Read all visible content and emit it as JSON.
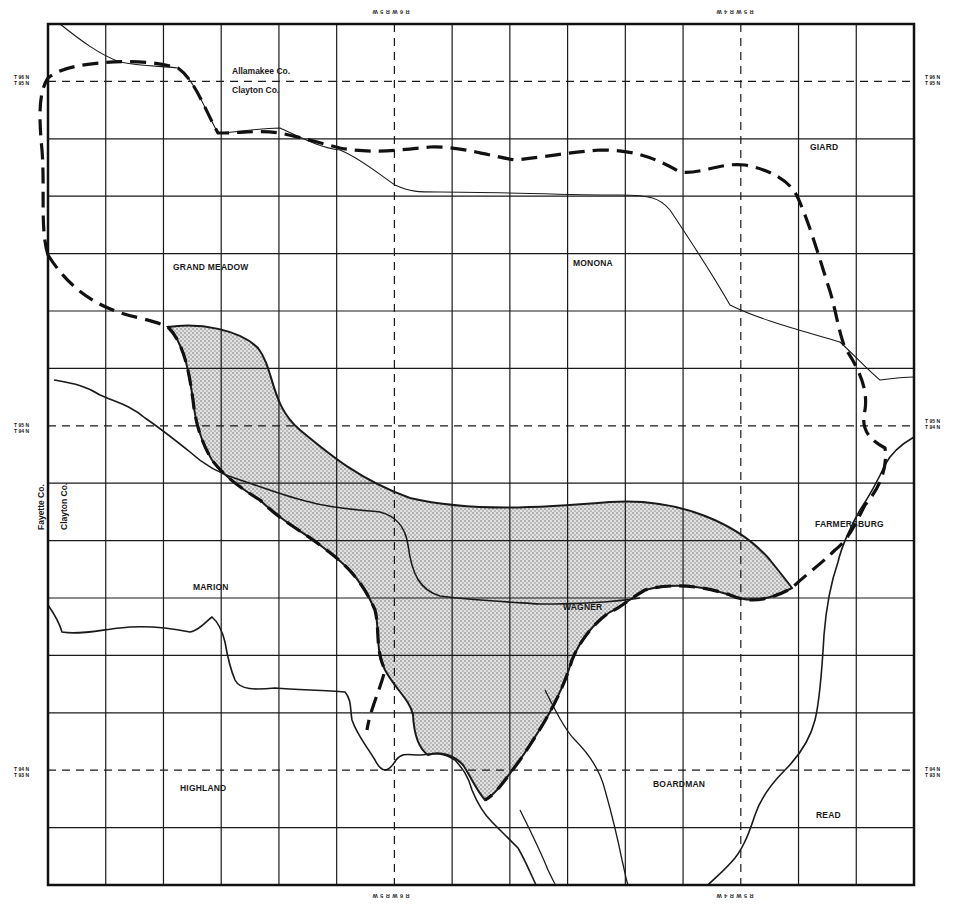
{
  "map": {
    "frame": {
      "x": 48,
      "y": 24,
      "width": 866,
      "height": 861
    },
    "grid": {
      "columns": 15,
      "rows": 15,
      "dashed_columns": [
        6,
        12
      ],
      "dashed_rows": [
        1,
        7,
        13
      ],
      "line_color": "#1a1a1a",
      "frame_color": "#111111"
    },
    "colors": {
      "ink": "#1a1a1a",
      "shade_fill": "#d6d6d6",
      "background": "#ffffff"
    },
    "township_labels": [
      {
        "id": "grand-meadow",
        "text": "GRAND MEADOW",
        "x": 173,
        "y": 263
      },
      {
        "id": "monona",
        "text": "MONONA",
        "x": 573,
        "y": 259
      },
      {
        "id": "giard",
        "text": "GIARD",
        "x": 810,
        "y": 143
      },
      {
        "id": "farmersburg",
        "text": "FARMERSBURG",
        "x": 815,
        "y": 520
      },
      {
        "id": "marion",
        "text": "MARION",
        "x": 193,
        "y": 583
      },
      {
        "id": "wagner",
        "text": "WAGNER",
        "x": 563,
        "y": 603
      },
      {
        "id": "highland",
        "text": "HIGHLAND",
        "x": 180,
        "y": 784
      },
      {
        "id": "boardman",
        "text": "BOARDMAN",
        "x": 653,
        "y": 780
      },
      {
        "id": "read",
        "text": "READ",
        "x": 816,
        "y": 811
      }
    ],
    "county_labels": [
      {
        "id": "allamakee",
        "text": "Allamakee Co.",
        "x": 232,
        "y": 67
      },
      {
        "id": "clayton-top",
        "text": "Clayton Co.",
        "x": 232,
        "y": 86
      }
    ],
    "vertical_county_labels": [
      {
        "id": "fayette",
        "text": "Fayette Co.",
        "x": 37,
        "y": 530
      },
      {
        "id": "clayton-left",
        "text": "Clayton Co.",
        "x": 60,
        "y": 530
      }
    ],
    "range_labels": [
      {
        "id": "top-left",
        "text": "R 6 W R 5 W",
        "x": 372,
        "y": 8
      },
      {
        "id": "top-right",
        "text": "R 5 W R 4 W",
        "x": 716,
        "y": 8
      },
      {
        "id": "bottom-left",
        "text": "R 6 W R 5 W",
        "x": 372,
        "y": 892
      },
      {
        "id": "bottom-right",
        "text": "R 5 W R 4 W",
        "x": 716,
        "y": 892
      }
    ],
    "township_row_labels": [
      {
        "id": "left-96-95",
        "top": "T 96 N",
        "bottom": "T 95 N",
        "x": 14,
        "y": 74
      },
      {
        "id": "left-95-94",
        "top": "T 95 N",
        "bottom": "T 94 N",
        "x": 14,
        "y": 422
      },
      {
        "id": "left-94-93",
        "top": "T 94 N",
        "bottom": "T 93 N",
        "x": 14,
        "y": 766
      },
      {
        "id": "right-96-95",
        "top": "T 96 N",
        "bottom": "T 95 N",
        "x": 925,
        "y": 74
      },
      {
        "id": "right-95-94",
        "top": "T 95 N",
        "bottom": "T 94 N",
        "x": 925,
        "y": 418
      },
      {
        "id": "right-94-93",
        "top": "T 94 N",
        "bottom": "T 93 N",
        "x": 925,
        "y": 766
      }
    ],
    "paths": {
      "shaded_area": "M168,327 C200,322 240,330 258,348 C275,370 270,405 300,430 C330,455 360,480 410,498 C470,512 540,508 610,502 C680,497 740,525 770,560 C782,575 790,585 792,588 C770,600 750,604 730,595 C700,585 670,583 645,590 C628,600 620,608 610,612 C595,622 580,640 572,660 C560,700 540,730 520,760 C505,780 495,795 485,800 C476,790 470,775 463,765 C455,756 440,750 428,755 C418,748 414,735 413,715 C410,700 396,690 385,670 C375,650 380,630 375,610 C360,575 340,560 320,545 C300,530 280,520 260,500 C240,488 222,474 212,460 C200,440 195,420 193,400 C190,380 186,345 168,327 Z",
      "dashed_boundary": "M48,255 C40,230 45,190 42,150 C38,110 40,90 48,78 C60,68 80,65 100,63 C120,61 150,60 178,68 C195,80 205,110 218,133 C240,133 260,130 280,133 C300,137 320,143 340,148 C370,154 400,150 430,147 C460,146 490,156 515,160 C545,157 570,152 600,150 C630,150 650,155 680,172 C700,175 720,162 745,165 C770,170 790,180 798,198 C810,225 820,260 828,285 C835,305 838,330 845,348 C860,370 868,390 865,410 C860,430 870,440 885,448 C888,470 878,490 865,505 C855,525 848,540 835,550 C820,565 805,575 792,588 C770,600 750,604 730,595 C700,585 670,583 645,590 C628,600 620,608 610,612 C595,622 580,640 572,660 C560,700 540,730 520,760 C505,780 495,795 485,800 M48,255 C70,290 100,310 140,318 C155,322 165,325 168,327 C186,345 190,380 193,400 C195,420 200,440 212,460 C222,474 240,488 260,500 C280,520 300,530 320,545 C340,560 360,575 375,610 C380,630 375,650 385,670 C380,690 370,710 367,730",
      "county_line_top": "M60,24 C80,40 100,55 120,62 C140,66 160,66 178,68 C195,80 205,110 218,133 C240,132 260,128 280,128 C300,137 320,148 340,150 C360,158 380,175 395,185 C410,192 418,192 440,192 C500,192 560,195 620,195 C650,195 660,198 670,210 C690,240 710,270 730,305 C760,320 800,330 840,342 C855,356 870,372 880,380 C895,378 905,377 914,377",
      "county_line_left": "M54,380 C70,383 85,385 100,395 C115,402 130,405 145,418 C160,428 175,440 190,452 C205,466 220,474 240,480 C265,488 290,498 310,502 C330,508 360,510 380,512 C395,516 405,525 408,545 C412,575 420,590 440,596 C470,600 510,602 540,604 C560,604 600,604 640,598",
      "river_main": "M48,605 C55,615 60,625 62,632 C80,635 100,630 120,628 C145,625 170,628 190,632 C200,630 205,622 212,617 C218,622 222,630 225,642 C228,660 230,668 235,680 C240,690 255,690 275,688 C300,690 325,690 345,692 C352,700 350,710 352,720 C357,735 366,745 375,760 C383,776 390,770 396,760 C402,752 410,755 418,755 C428,755 440,750 455,760 C462,768 468,775 472,790 C478,805 485,815 492,822 C500,830 510,840 518,848 C525,860 530,872 536,885",
      "river_east": "M914,437 C900,445 890,455 885,465 C878,480 870,495 860,510 C850,528 842,545 838,562 C830,585 826,610 824,635 C822,670 820,700 815,720 C810,740 800,755 785,770 C770,785 760,800 755,815 C750,830 745,845 735,858 C725,870 715,878 708,885",
      "river_boardman": "M545,690 C555,710 565,730 575,740 C590,755 600,770 605,790 C612,815 618,840 622,860 C625,872 626,880 628,885",
      "river_sw": "M520,810 C530,830 540,850 548,870 C552,878 555,885 556,885"
    }
  }
}
